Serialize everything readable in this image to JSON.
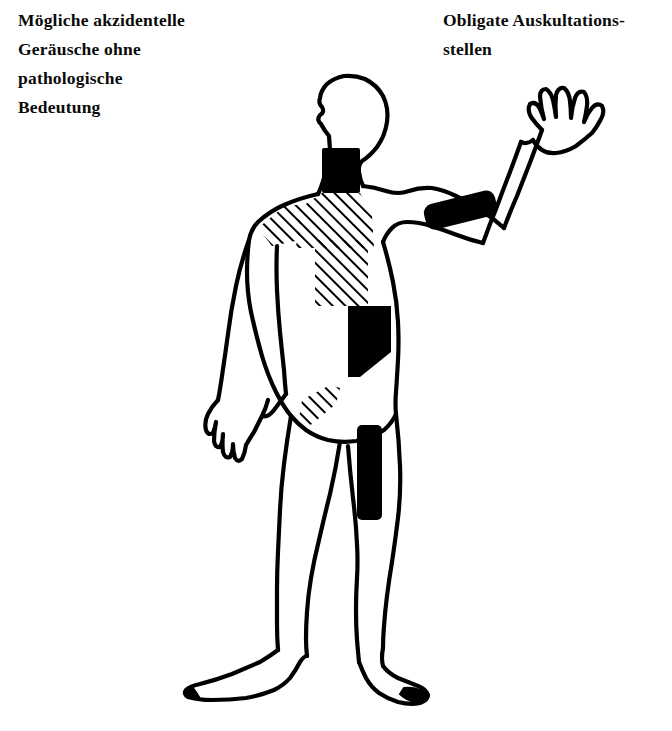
{
  "page": {
    "width": 672,
    "height": 731,
    "background": "#ffffff",
    "ink_color": "#000000",
    "language": "de"
  },
  "captions": {
    "left": {
      "text": "Mögliche akzidentelle\nGeräusche ohne\npathologische\nBedeutung",
      "lines": [
        "Mögliche akzidentelle",
        "Geräusche ohne",
        "pathologische",
        "Bedeutung"
      ],
      "meaning_marker": "hatched"
    },
    "right": {
      "text": "Obligate Auskultations-\nstellen",
      "lines": [
        "Obligate Auskultations-",
        "stellen"
      ],
      "meaning_marker": "solid-black"
    }
  },
  "figure": {
    "name": "human-body-outline-anterior",
    "pose": {
      "head": "left-profile",
      "right_arm": "raised-open-hand",
      "left_arm": "hanging-down",
      "stance": "standing-barefoot"
    }
  },
  "markers": {
    "solid_black": [
      {
        "name": "neck-carotid-marker",
        "label": "Hals / Karotis",
        "shape": "rect",
        "x": 322,
        "y": 148,
        "w": 38,
        "h": 45,
        "color": "#000000"
      },
      {
        "name": "upper-arm-brachial-marker",
        "label": "Oberarm / A. brachialis",
        "shape": "rounded-bar",
        "x": 424,
        "y": 197,
        "w": 73,
        "h": 26,
        "rotation": -14,
        "color": "#000000"
      },
      {
        "name": "precordium-heart-marker",
        "label": "Herz / Präkordium",
        "shape": "polygon",
        "x": 348,
        "y": 305,
        "w": 44,
        "h": 72,
        "color": "#000000"
      },
      {
        "name": "thigh-femoral-marker",
        "label": "Oberschenkel / A. femoralis",
        "shape": "rounded-rect",
        "x": 357,
        "y": 425,
        "w": 25,
        "h": 95,
        "color": "#000000"
      }
    ],
    "hatched": [
      {
        "name": "clavicle-hatch-marker",
        "label": "Supraklavikulär / Schlüsselbeinregion",
        "shape": "triangle-band",
        "x": 296,
        "y": 192,
        "w": 78,
        "h": 56,
        "hatch_angle_deg": 45
      },
      {
        "name": "chest-hatch-marker",
        "label": "Oberer Thorax",
        "shape": "square",
        "x": 315,
        "y": 240,
        "w": 53,
        "h": 66,
        "hatch_angle_deg": 45
      },
      {
        "name": "groin-hatch-marker",
        "label": "Leiste",
        "shape": "small-triangle",
        "x": 296,
        "y": 385,
        "w": 44,
        "h": 46,
        "hatch_angle_deg": 45
      }
    ]
  },
  "legend": {
    "solid_label": "Obligate Auskultationsstellen",
    "hatched_label": "Mögliche akzidentelle Geräusche ohne pathologische Bedeutung"
  }
}
